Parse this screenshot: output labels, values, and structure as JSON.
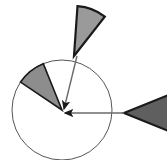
{
  "figure": {
    "background_color": "#ffffff",
    "width": 167,
    "height": 160
  },
  "pie": {
    "name": "base-circle",
    "center_x": 62,
    "center_y": 110,
    "radius": 50,
    "fill_color": "#ffffff",
    "stroke_color": "#555555",
    "stroke_width": 1
  },
  "wedges": [
    {
      "id": "inner-wedge",
      "label": "attached-wedge",
      "fill_color": "#8d8d8d",
      "stroke_color": "#1a1a1a",
      "stroke_width": 1.6,
      "apex_x": 62,
      "apex_y": 110,
      "radius": 50,
      "start_angle_deg": 112,
      "end_angle_deg": 146,
      "detached": false
    },
    {
      "id": "top-wedge",
      "label": "detached-wedge-top",
      "fill_color": "#9a9a9a",
      "stroke_color": "#1a1a1a",
      "stroke_width": 2.2,
      "apex_x": 74,
      "apex_y": 56,
      "radius": 50,
      "start_angle_deg": 52,
      "end_angle_deg": 86,
      "detached": true
    },
    {
      "id": "right-wedge",
      "label": "detached-wedge-right",
      "fill_color": "#5f5f5f",
      "stroke_color": "#1a1a1a",
      "stroke_width": 2.2,
      "apex_x": 124,
      "apex_y": 113,
      "radius": 50,
      "start_angle_deg": -22,
      "end_angle_deg": 22,
      "detached": true
    }
  ],
  "arrows": [
    {
      "id": "arrow-from-top-wedge",
      "label": "arrow-diagonal",
      "from_x": 77,
      "from_y": 56,
      "to_x": 64,
      "to_y": 109,
      "color": "#6a6a6a",
      "stroke_width": 1.4,
      "head_color": "#1a1a1a",
      "head_size": 7
    },
    {
      "id": "arrow-from-right-wedge",
      "label": "arrow-horizontal",
      "from_x": 124,
      "from_y": 113,
      "to_x": 65,
      "to_y": 113,
      "color": "#6a6a6a",
      "stroke_width": 1.4,
      "head_color": "#1a1a1a",
      "head_size": 7
    }
  ],
  "chart_data": {
    "type": "pie",
    "categories": [
      "attached slice",
      "detached slice (top)",
      "detached slice (right)",
      "remainder"
    ],
    "values": [
      9.4,
      9.4,
      12.2,
      69.0
    ],
    "angles_deg": [
      34,
      34,
      44,
      248
    ],
    "colors": [
      "#8d8d8d",
      "#9a9a9a",
      "#5f5f5f",
      "#ffffff"
    ],
    "xlabel": "",
    "ylabel": "",
    "legend": "none",
    "grid": false,
    "annotations": [
      "arrow from top detached wedge to pie center",
      "arrow from right detached wedge to pie center"
    ]
  }
}
